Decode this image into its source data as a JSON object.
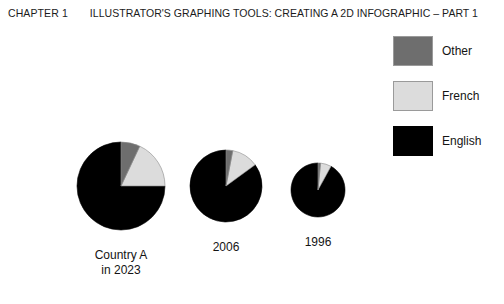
{
  "header": {
    "chapter": "CHAPTER 1",
    "title": "ILLUSTRATOR'S GRAPHING TOOLS: CREATING A 2D INFOGRAPHIC – PART 1"
  },
  "legend": {
    "items": [
      {
        "label": "Other",
        "color": "#6e6e6e",
        "bordered": true
      },
      {
        "label": "French",
        "color": "#dcdcdc",
        "bordered": true
      },
      {
        "label": "English",
        "color": "#000000",
        "bordered": false
      }
    ]
  },
  "chart_data": {
    "type": "pie",
    "title": "",
    "legend_position": "top-right",
    "series_names": [
      "English",
      "French",
      "Other"
    ],
    "colors": {
      "English": "#000000",
      "French": "#dcdcdc",
      "Other": "#6e6e6e"
    },
    "charts": [
      {
        "label": "Country A\nin 2023",
        "radius_px": 44,
        "center_px": [
          121,
          186
        ],
        "slices": [
          {
            "name": "English",
            "value": 75
          },
          {
            "name": "French",
            "value": 18
          },
          {
            "name": "Other",
            "value": 7
          }
        ]
      },
      {
        "label": "2006",
        "radius_px": 36,
        "center_px": [
          226,
          186
        ],
        "slices": [
          {
            "name": "English",
            "value": 85
          },
          {
            "name": "French",
            "value": 12
          },
          {
            "name": "Other",
            "value": 3
          }
        ]
      },
      {
        "label": "1996",
        "radius_px": 27,
        "center_px": [
          318,
          190
        ],
        "slices": [
          {
            "name": "English",
            "value": 92
          },
          {
            "name": "French",
            "value": 6.5
          },
          {
            "name": "Other",
            "value": 1.5
          }
        ]
      }
    ]
  }
}
